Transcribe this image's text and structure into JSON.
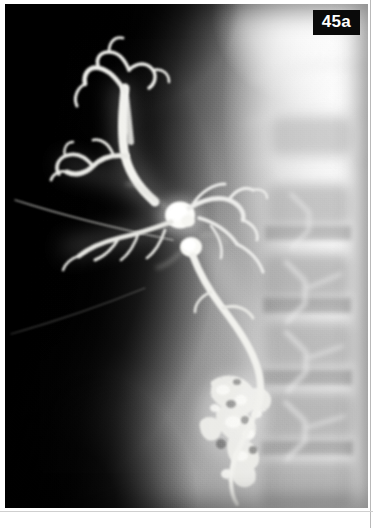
{
  "figure": {
    "label": "45a",
    "label_background": "#0a0a0a",
    "label_color": "#ffffff",
    "modality": "percutaneous-transhepatic-cholangiogram",
    "caption_visible": false
  },
  "plate": {
    "name": "radiograph-plate",
    "width": 363,
    "height": 504,
    "border_color": "#ffffff",
    "background": "#050505"
  },
  "image_map": {
    "background_dark_region": "left-liver-shadow",
    "background_bright_region": "right-flank-overexposed",
    "grain": "film-grain",
    "vignette": true
  },
  "anatomy": {
    "contrast_color": "#f4f4f0",
    "structures": [
      {
        "id": "left-hepatic-radicles",
        "label": "Left hepatic duct radicles",
        "region": "upper-left"
      },
      {
        "id": "right-hepatic-radicles",
        "label": "Right hepatic duct radicles",
        "region": "upper-center"
      },
      {
        "id": "dilated-intrahepatic-duct",
        "label": "Dilated intrahepatic duct",
        "region": "upper-center"
      },
      {
        "id": "hilar-confluence",
        "label": "Hilar confluence",
        "region": "center"
      },
      {
        "id": "common-hepatic-duct",
        "label": "Common hepatic duct",
        "region": "center"
      },
      {
        "id": "common-bile-duct",
        "label": "Common bile duct",
        "region": "center-lower"
      },
      {
        "id": "duodenal-contrast",
        "label": "Contrast in duodenum",
        "region": "lower-center"
      },
      {
        "id": "lumbar-vertebrae",
        "label": "Lumbar vertebral bodies",
        "region": "right"
      },
      {
        "id": "transverse-processes",
        "label": "Transverse processes",
        "region": "right"
      },
      {
        "id": "catheter-wire",
        "label": "Transhepatic catheter track",
        "region": "mid-left"
      }
    ]
  },
  "page": {
    "width": 373,
    "height": 528,
    "background": "#ffffff"
  }
}
